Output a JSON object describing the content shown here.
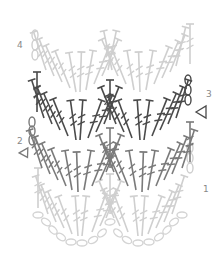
{
  "diagram": {
    "type": "crochet-chart",
    "pattern": "chevron / ripple",
    "rows": [
      {
        "number": "1",
        "label_pos": {
          "x": 204,
          "y": 185
        },
        "color": "#cfcfcf",
        "stitch": "treble-crochet",
        "direction": "right-to-left",
        "start": "chain-loop"
      },
      {
        "number": "2",
        "label_pos": {
          "x": 17,
          "y": 137
        },
        "color": "#7a7a7a",
        "stitch": "treble-crochet",
        "direction": "left-to-right",
        "start": "chain-loop",
        "marker": "triangle-left"
      },
      {
        "number": "3",
        "label_pos": {
          "x": 207,
          "y": 90
        },
        "color": "#4a4a4a",
        "stitch": "treble-crochet",
        "direction": "right-to-left",
        "start": "chain-loop",
        "marker": "triangle-right"
      },
      {
        "number": "4",
        "label_pos": {
          "x": 17,
          "y": 41
        },
        "color": "#cfcfcf",
        "stitch": "treble-crochet",
        "direction": "left-to-right",
        "start": "chain-loop"
      }
    ],
    "foundation": {
      "stitch": "chain",
      "color": "#d4d4d4"
    },
    "colors": {
      "light": "#cfcfcf",
      "medium": "#7a7a7a",
      "dark": "#4a4a4a",
      "label": "#888888"
    }
  }
}
